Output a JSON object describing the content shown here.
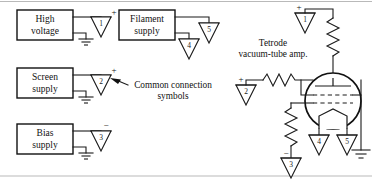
{
  "figure": {
    "background": "#ffffff",
    "ink_color": "#111111",
    "frame_color": "#b9b9b9",
    "width": 372,
    "height": 191
  },
  "supplies": [
    {
      "id": "high-voltage",
      "label_line1": "High",
      "label_line2": "voltage",
      "terminal_symbol": "1",
      "terminal_polarity": "+",
      "has_ground": true
    },
    {
      "id": "filament-supply",
      "label_line1": "Filament",
      "label_line2": "supply",
      "terminal_symbol": "5",
      "terminal_polarity": "",
      "second_terminal_symbol": "4",
      "has_ground": false
    },
    {
      "id": "screen-supply",
      "label_line1": "Screen",
      "label_line2": "supply",
      "terminal_symbol": "2",
      "terminal_polarity": "+",
      "has_ground": true
    },
    {
      "id": "bias-supply",
      "label_line1": "Bias",
      "label_line2": "supply",
      "terminal_symbol": "3",
      "terminal_polarity": "−",
      "has_ground": true
    }
  ],
  "annotation": {
    "line1": "Common connection",
    "line2": "symbols",
    "arrow": "points-left-to-screen-supply-terminal"
  },
  "amplifier": {
    "label_line1": "Tetrode",
    "label_line2": "vacuum-tube amp.",
    "plate_supply_symbol": "1",
    "plate_supply_polarity": "+",
    "screen_input_symbol": "2",
    "screen_input_polarity": "+",
    "grid_return_symbol": "3",
    "grid_return_polarity": "−",
    "filament_symbol_left": "4",
    "filament_symbol_right": "5",
    "has_cathode_ground": true,
    "element_names": [
      "plate",
      "screen-grid",
      "control-grid",
      "cathode"
    ]
  },
  "components": {
    "plate_resistor": "plate-load-resistor",
    "grid_resistor": "grid-series-resistor",
    "bias_resistor": "grid-bias-resistor"
  }
}
